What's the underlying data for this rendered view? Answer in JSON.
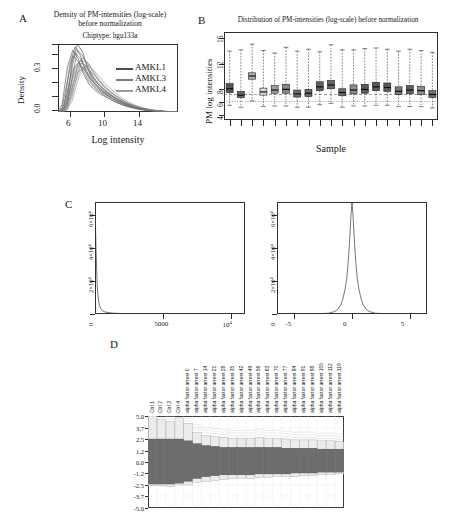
{
  "figure": {
    "panels": [
      "A",
      "B",
      "C",
      "D"
    ],
    "background": "#ffffff"
  },
  "panelA": {
    "letter": "A",
    "title_line1": "Density of PM-intensities (log-scale)",
    "title_line2": "before normalization",
    "subtitle": "Chiptype: hgu133a",
    "ylabel": "Density",
    "xlabel": "Log intensity",
    "legend": [
      {
        "label": "AMKL1",
        "color": "#4f4f4f"
      },
      {
        "label": "AMKL3",
        "color": "#7a7a7a"
      },
      {
        "label": "AMKL4",
        "color": "#9a9a9a"
      }
    ],
    "chart_data": {
      "type": "line",
      "title": "Density of PM-intensities (log-scale) before normalization",
      "subtitle": "Chiptype: hgu133a",
      "xlabel": "Log intensity",
      "ylabel": "Density",
      "xlim": [
        4.4,
        15.6
      ],
      "ylim": [
        0.0,
        0.46
      ],
      "xticks": [
        6,
        10,
        14
      ],
      "yticks": [
        0.0,
        0.3
      ],
      "ytick_labels": [
        "0.0",
        "0.3"
      ],
      "grid": false,
      "legend_position": "right",
      "x": [
        4.5,
        5.0,
        5.5,
        6.0,
        6.5,
        7.0,
        7.5,
        8.0,
        8.5,
        9.0,
        9.5,
        10.0,
        10.5,
        11.0,
        11.5,
        12.0,
        12.5,
        13.0,
        13.5,
        14.0,
        14.5,
        15.0,
        15.5
      ],
      "series": [
        {
          "name": "AMKL1",
          "color": "#454545",
          "values": [
            0.0,
            0.05,
            0.32,
            0.44,
            0.38,
            0.27,
            0.2,
            0.16,
            0.13,
            0.11,
            0.09,
            0.07,
            0.055,
            0.042,
            0.032,
            0.024,
            0.017,
            0.012,
            0.008,
            0.005,
            0.003,
            0.001,
            0.0
          ]
        },
        {
          "name": "AMKL3",
          "color": "#6e6e6e",
          "values": [
            0.0,
            0.02,
            0.14,
            0.3,
            0.35,
            0.31,
            0.25,
            0.2,
            0.16,
            0.13,
            0.105,
            0.082,
            0.063,
            0.047,
            0.035,
            0.025,
            0.018,
            0.012,
            0.008,
            0.005,
            0.003,
            0.001,
            0.0
          ]
        },
        {
          "name": "AMKL4",
          "color": "#8f8f8f",
          "values": [
            0.0,
            0.01,
            0.07,
            0.2,
            0.29,
            0.3,
            0.27,
            0.23,
            0.19,
            0.155,
            0.125,
            0.098,
            0.075,
            0.056,
            0.041,
            0.029,
            0.02,
            0.013,
            0.009,
            0.005,
            0.003,
            0.001,
            0.0
          ]
        },
        {
          "name": "extra-1",
          "color": "#5c5c5c",
          "values": [
            0.0,
            0.03,
            0.22,
            0.4,
            0.36,
            0.29,
            0.22,
            0.175,
            0.142,
            0.115,
            0.092,
            0.072,
            0.055,
            0.041,
            0.03,
            0.021,
            0.015,
            0.01,
            0.006,
            0.004,
            0.002,
            0.001,
            0.0
          ]
        },
        {
          "name": "extra-2",
          "color": "#7d7d7d",
          "values": [
            0.0,
            0.015,
            0.1,
            0.25,
            0.33,
            0.315,
            0.26,
            0.21,
            0.17,
            0.138,
            0.11,
            0.086,
            0.066,
            0.049,
            0.036,
            0.026,
            0.018,
            0.012,
            0.008,
            0.005,
            0.003,
            0.001,
            0.0
          ]
        }
      ]
    }
  },
  "panelB": {
    "letter": "B",
    "title": "Distribution of PM-intensities (log-scale) before normalization",
    "ylabel": "PM log intensities",
    "xlabel": "Sample",
    "chart_data": {
      "type": "box",
      "title": "Distribution of PM-intensities (log-scale) before normalization",
      "xlabel": "Sample",
      "ylabel": "PM log intensities",
      "ylim": [
        3.2,
        17.0
      ],
      "yticks": [
        4,
        6,
        8,
        12,
        16
      ],
      "ytick_labels": [
        "4",
        "6",
        "8",
        "12",
        "16"
      ],
      "grid": false,
      "reference_lines": [
        7.2,
        6.1
      ],
      "n_samples": 19,
      "boxes": [
        {
          "sample": 1,
          "whisker_low": 5.5,
          "q1": 7.5,
          "median": 8.1,
          "q3": 8.9,
          "whisker_high": 14.0,
          "fill": "#555555"
        },
        {
          "sample": 2,
          "whisker_low": 5.2,
          "q1": 6.7,
          "median": 7.1,
          "q3": 7.7,
          "whisker_high": 14.2,
          "fill": "#6a6a6a"
        },
        {
          "sample": 3,
          "whisker_low": 6.2,
          "q1": 9.6,
          "median": 10.1,
          "q3": 10.6,
          "whisker_high": 15.1,
          "fill": "#b3b3b3"
        },
        {
          "sample": 4,
          "whisker_low": 5.3,
          "q1": 7.1,
          "median": 7.6,
          "q3": 8.2,
          "whisker_high": 14.1,
          "fill": "#dcdcdc"
        },
        {
          "sample": 5,
          "whisker_low": 5.4,
          "q1": 7.4,
          "median": 7.9,
          "q3": 8.6,
          "whisker_high": 13.7,
          "fill": "#9e9e9e"
        },
        {
          "sample": 6,
          "whisker_low": 5.4,
          "q1": 7.4,
          "median": 8.0,
          "q3": 8.8,
          "whisker_high": 14.6,
          "fill": "#8a8a8a"
        },
        {
          "sample": 7,
          "whisker_low": 5.2,
          "q1": 6.8,
          "median": 7.3,
          "q3": 7.9,
          "whisker_high": 14.0,
          "fill": "#707070"
        },
        {
          "sample": 8,
          "whisker_low": 5.2,
          "q1": 6.9,
          "median": 7.4,
          "q3": 8.0,
          "whisker_high": 14.3,
          "fill": "#6b6b6b"
        },
        {
          "sample": 9,
          "whisker_low": 5.6,
          "q1": 7.8,
          "median": 8.4,
          "q3": 9.2,
          "whisker_high": 13.9,
          "fill": "#5f5f5f"
        },
        {
          "sample": 10,
          "whisker_low": 5.8,
          "q1": 8.1,
          "median": 8.7,
          "q3": 9.4,
          "whisker_high": 15.0,
          "fill": "#646464"
        },
        {
          "sample": 11,
          "whisker_low": 5.2,
          "q1": 7.0,
          "median": 7.5,
          "q3": 8.1,
          "whisker_high": 14.2,
          "fill": "#6d6d6d"
        },
        {
          "sample": 12,
          "whisker_low": 5.4,
          "q1": 7.3,
          "median": 7.9,
          "q3": 8.7,
          "whisker_high": 14.2,
          "fill": "#8b8b8b"
        },
        {
          "sample": 13,
          "whisker_low": 5.4,
          "q1": 7.4,
          "median": 8.0,
          "q3": 8.8,
          "whisker_high": 14.4,
          "fill": "#5a5a5a"
        },
        {
          "sample": 14,
          "whisker_low": 5.5,
          "q1": 7.8,
          "median": 8.4,
          "q3": 9.1,
          "whisker_high": 14.5,
          "fill": "#585858"
        },
        {
          "sample": 15,
          "whisker_low": 5.5,
          "q1": 7.7,
          "median": 8.3,
          "q3": 9.0,
          "whisker_high": 14.3,
          "fill": "#5d5d5d"
        },
        {
          "sample": 16,
          "whisker_low": 5.3,
          "q1": 7.2,
          "median": 7.7,
          "q3": 8.4,
          "whisker_high": 14.0,
          "fill": "#7a7a7a"
        },
        {
          "sample": 17,
          "whisker_low": 5.3,
          "q1": 7.3,
          "median": 7.9,
          "q3": 8.6,
          "whisker_high": 14.3,
          "fill": "#606060"
        },
        {
          "sample": 18,
          "whisker_low": 5.3,
          "q1": 7.2,
          "median": 7.8,
          "q3": 8.5,
          "whisker_high": 14.1,
          "fill": "#8d8d8d"
        },
        {
          "sample": 19,
          "whisker_low": 5.1,
          "q1": 6.7,
          "median": 7.2,
          "q3": 7.8,
          "whisker_high": 13.8,
          "fill": "#6f6f6f"
        }
      ]
    }
  },
  "panelC": {
    "letter": "C",
    "left": {
      "chart_data": {
        "type": "line",
        "title": "",
        "xlabel": "",
        "ylabel": "",
        "xlim": [
          0,
          11000
        ],
        "ylim": [
          0,
          68000
        ],
        "xticks": [
          5000,
          10000
        ],
        "xtick_labels": [
          "5000",
          "10^4"
        ],
        "yticks": [
          0,
          20000,
          40000,
          60000
        ],
        "ytick_labels": [
          "0",
          "2×10⁴",
          "4×10⁴",
          "6×10⁴"
        ],
        "grid": false,
        "x": [
          0,
          80,
          160,
          240,
          330,
          430,
          560,
          720,
          950,
          1300,
          1900,
          2700,
          4000,
          5500,
          7000,
          8500,
          10000,
          11000
        ],
        "values": [
          66000,
          38000,
          18000,
          9000,
          5200,
          3200,
          2000,
          1300,
          850,
          520,
          300,
          180,
          100,
          60,
          40,
          26,
          16,
          10
        ]
      }
    },
    "right": {
      "chart_data": {
        "type": "line",
        "title": "",
        "xlabel": "",
        "ylabel": "",
        "xlim": [
          -6.5,
          6.5
        ],
        "ylim": [
          0,
          68000
        ],
        "xticks": [
          -5,
          0,
          5
        ],
        "xtick_labels": [
          "-5",
          "0",
          "5"
        ],
        "yticks": [
          0,
          20000,
          40000,
          60000
        ],
        "ytick_labels": [
          "0",
          "2×10⁴",
          "4×10⁴",
          "6×10⁴"
        ],
        "grid": false,
        "x": [
          -6.5,
          -3.0,
          -2.0,
          -1.5,
          -1.2,
          -1.0,
          -0.8,
          -0.6,
          -0.45,
          -0.3,
          -0.18,
          -0.08,
          0.0,
          0.08,
          0.18,
          0.3,
          0.45,
          0.6,
          0.8,
          1.0,
          1.2,
          1.5,
          2.0,
          3.0,
          6.5
        ],
        "values": [
          0,
          100,
          500,
          1500,
          3000,
          5200,
          9000,
          15000,
          22000,
          34000,
          48000,
          61000,
          67500,
          61000,
          48000,
          34000,
          22000,
          15000,
          9000,
          5200,
          3000,
          1500,
          500,
          100,
          0
        ]
      }
    }
  },
  "panelD": {
    "letter": "D",
    "chart_data": {
      "type": "area",
      "title": "",
      "xlabel": "",
      "ylabel": "",
      "ylim": [
        -5.0,
        5.0
      ],
      "yticks": [
        5.0,
        3.7,
        2.5,
        1.2,
        0.0,
        -1.2,
        -2.5,
        -3.7,
        -5.0
      ],
      "ytick_labels": [
        "5.0",
        "3.7",
        "2.5",
        "1.2",
        "0.0",
        "-1.2",
        "-2.5",
        "-3.7",
        "-5.0"
      ],
      "grid": true,
      "categories": [
        "Ctrl 1",
        "Ctrl 2",
        "Ctrl 3",
        "Ctrl 4",
        "alpha factor arrest 0",
        "alpha factor arrest 7",
        "alpha factor arrest 14",
        "alpha factor arrest 21",
        "alpha factor arrest 28",
        "alpha factor arrest 35",
        "alpha factor arrest 42",
        "alpha factor arrest 49",
        "alpha factor arrest 56",
        "alpha factor arrest 63",
        "alpha factor arrest 70",
        "alpha factor arrest 77",
        "alpha factor arrest 84",
        "alpha factor arrest 91",
        "alpha factor arrest 98",
        "alpha factor arrest 105",
        "alpha factor arrest 112",
        "alpha factor arrest 119"
      ],
      "band_upper": [
        5.0,
        4.6,
        4.4,
        4.8,
        4.2,
        3.2,
        2.9,
        2.8,
        2.7,
        2.6,
        2.6,
        2.6,
        2.7,
        2.6,
        2.6,
        2.5,
        2.4,
        2.4,
        2.4,
        2.3,
        2.3,
        2.2
      ],
      "band_lower": [
        -2.6,
        -2.6,
        -2.7,
        -2.5,
        -2.5,
        -2.2,
        -2.1,
        -2.0,
        -1.9,
        -1.8,
        -1.8,
        -1.8,
        -1.7,
        -1.7,
        -1.6,
        -1.6,
        -1.6,
        -1.5,
        -1.5,
        -1.4,
        -1.4,
        -1.3
      ],
      "core_upper": [
        2.5,
        2.5,
        2.5,
        2.5,
        2.3,
        2.0,
        1.8,
        1.7,
        1.6,
        1.6,
        1.6,
        1.6,
        1.6,
        1.6,
        1.6,
        1.5,
        1.5,
        1.5,
        1.5,
        1.4,
        1.4,
        1.4
      ],
      "core_lower": [
        -2.4,
        -2.4,
        -2.4,
        -2.3,
        -2.1,
        -1.8,
        -1.6,
        -1.5,
        -1.4,
        -1.4,
        -1.4,
        -1.4,
        -1.3,
        -1.3,
        -1.3,
        -1.3,
        -1.2,
        -1.2,
        -1.2,
        -1.1,
        -1.1,
        -1.1
      ]
    }
  }
}
